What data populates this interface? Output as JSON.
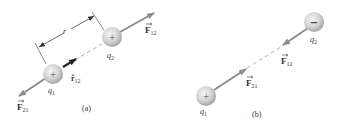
{
  "panels": [
    {
      "id": "a",
      "caption": "(a)",
      "charges": [
        {
          "name": "q",
          "sub": "1",
          "sign": "+"
        },
        {
          "name": "q",
          "sub": "2",
          "sign": "+"
        }
      ],
      "forces": [
        {
          "name": "F",
          "sub": "12",
          "direction": "away from q1 along line"
        },
        {
          "name": "F",
          "sub": "21",
          "direction": "away from q2 along line"
        }
      ],
      "unit_vector": {
        "name": "r̂",
        "sub": "12"
      },
      "distance_label": "r"
    },
    {
      "id": "b",
      "caption": "(b)",
      "charges": [
        {
          "name": "q",
          "sub": "1",
          "sign": "+"
        },
        {
          "name": "q",
          "sub": "2",
          "sign": "−"
        }
      ],
      "forces": [
        {
          "name": "F",
          "sub": "12",
          "direction": "toward q1"
        },
        {
          "name": "F",
          "sub": "21",
          "direction": "toward q2"
        }
      ]
    }
  ],
  "colors": {
    "arrow": "#8c8c8c",
    "dash": "#b0b0b0",
    "sphere_light": "#f4f4f4",
    "sphere_dark": "#a8a8a8",
    "unit_vector": "#222222",
    "text": "#333333"
  }
}
